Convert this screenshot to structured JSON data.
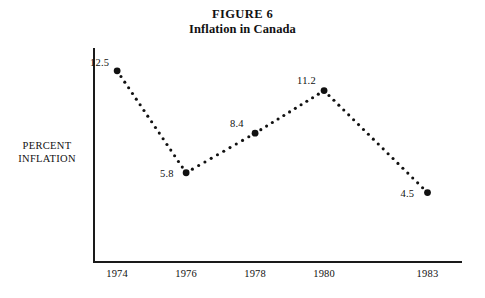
{
  "figure": {
    "title": "FIGURE 6",
    "subtitle": "Inflation in Canada"
  },
  "axes": {
    "y_title_line1": "PERCENT",
    "y_title_line2": "INFLATION"
  },
  "chart_data": {
    "type": "line",
    "title": "FIGURE 6",
    "subtitle": "Inflation in Canada",
    "xlabel": "",
    "ylabel": "PERCENT INFLATION",
    "grid": false,
    "legend": "none",
    "marker": "filled-circle",
    "linestyle": "dotted",
    "color": "#111111",
    "categories": [
      "1974",
      "1976",
      "1978",
      "1980",
      "1983"
    ],
    "x": [
      1974,
      1976,
      1978,
      1980,
      1983
    ],
    "values": [
      12.5,
      5.8,
      8.4,
      11.2,
      4.5
    ],
    "point_labels": [
      "12.5",
      "5.8",
      "8.4",
      "11.2",
      "4.5"
    ],
    "xlim": [
      1973.3,
      1984.0
    ],
    "ylim": [
      0,
      14
    ],
    "yticks": [],
    "xticks": [
      1974,
      1976,
      1978,
      1980,
      1983
    ],
    "xtick_labels": [
      "1974",
      "1976",
      "1978",
      "1980",
      "1983"
    ]
  }
}
